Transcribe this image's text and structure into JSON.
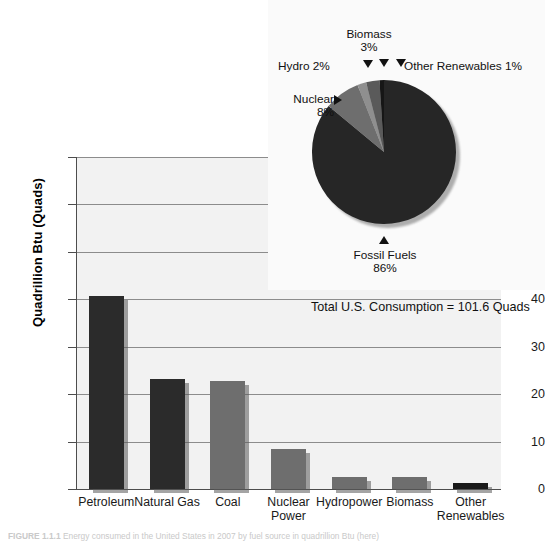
{
  "chart_data": [
    {
      "type": "bar",
      "title": "",
      "xlabel": "",
      "ylabel": "Quadrillion Btu (Quads)",
      "ylim": [
        0,
        70
      ],
      "yticks": [
        0,
        10,
        20,
        30,
        40,
        50,
        60,
        70
      ],
      "grid": true,
      "categories": [
        "Petroleum",
        "Natural Gas",
        "Coal",
        "Nuclear Power",
        "Hydropower",
        "Biomass",
        "Other Renewables"
      ],
      "values": [
        40.6,
        23.1,
        22.8,
        8.5,
        2.5,
        2.5,
        1.2
      ],
      "bar_colors": [
        "#2b2b2b",
        "#2b2b2b",
        "#6e6e6e",
        "#6e6e6e",
        "#6e6e6e",
        "#6e6e6e",
        "#1a1a1a"
      ],
      "annotation": "Total U.S. Consumption = 101.6 Quads"
    },
    {
      "type": "pie",
      "title": "",
      "labels": [
        "Fossil Fuels",
        "Nuclear",
        "Hydro",
        "Biomass",
        "Other Renewables"
      ],
      "values": [
        86,
        8,
        2,
        3,
        1
      ],
      "display_labels": [
        "Fossil Fuels\n86%",
        "Nuclear\n8%",
        "Hydro 2%",
        "Biomass\n3%",
        "Other Renewables 1%"
      ],
      "slice_colors": [
        "#262626",
        "#6e6e6e",
        "#8f8f8f",
        "#5a5a5a",
        "#161616"
      ],
      "legend_position": "callouts"
    }
  ],
  "bar_chart": {
    "y_axis_title": "Quadrillion Btu (Quads)",
    "y_ticks": [
      "0",
      "10",
      "20",
      "30",
      "40",
      "50",
      "60",
      "70"
    ],
    "x_labels": [
      {
        "line1": "Petroleum",
        "line2": ""
      },
      {
        "line1": "Natural Gas",
        "line2": ""
      },
      {
        "line1": "Coal",
        "line2": ""
      },
      {
        "line1": "Nuclear",
        "line2": "Power"
      },
      {
        "line1": "Hydropower",
        "line2": ""
      },
      {
        "line1": "Biomass",
        "line2": ""
      },
      {
        "line1": "Other",
        "line2": "Renewables"
      }
    ],
    "annotation": "Total U.S. Consumption = 101.6 Quads"
  },
  "pie_chart": {
    "fossil_fuels_label": "Fossil Fuels",
    "fossil_fuels_value": "86%",
    "nuclear_label": "Nuclear",
    "nuclear_value": "8%",
    "hydro_label": "Hydro 2%",
    "biomass_label": "Biomass",
    "biomass_value": "3%",
    "other_renewables_label": "Other Renewables 1%"
  },
  "caption": {
    "figure_number": "FIGURE 1.1.1",
    "text": "Energy consumed in the United States in 2007 by fuel source in quadrillion Btu (here)"
  }
}
